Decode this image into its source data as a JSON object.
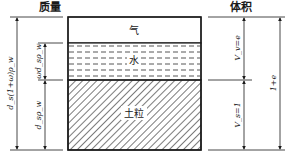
{
  "headers": {
    "mass": "质量",
    "volume": "体积"
  },
  "phases": {
    "air": "气",
    "water": "水",
    "solid": "土粒"
  },
  "mass_labels": {
    "total": "d_s(1+ω)ρ_w",
    "water": "ωd_sρ_w",
    "solid": "d_sρ_w"
  },
  "volume_labels": {
    "voids": "V_v=e",
    "solid": "V_s=1",
    "total": "1+e"
  },
  "colors": {
    "line": "#1a1a1a",
    "background": "#ffffff",
    "hatch": "#333333",
    "dash": "#444444"
  }
}
